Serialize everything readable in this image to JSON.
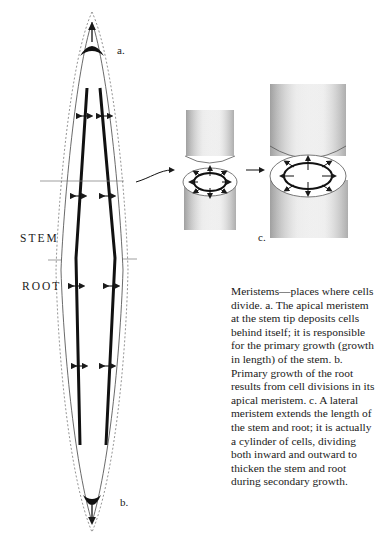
{
  "figure": {
    "labels": {
      "a": "a.",
      "b": "b.",
      "c": "c.",
      "stem": "STEM",
      "root": "ROOT"
    },
    "caption": "Meristems—places where cells divide. a. The apical meristem at the stem tip deposits cells behind itself; it is responsible for the primary growth (growth in length) of the stem. b. Primary growth of the root results from cell divisions in its apical meristem. c. A lateral meristem extends the length of the stem and root; it is actually a cylinder of cells, dividing both inward and outward to thicken the stem and root during secondary growth.",
    "colors": {
      "ink": "#1a1a1a",
      "outline": "#555555",
      "background": "#ffffff"
    }
  }
}
